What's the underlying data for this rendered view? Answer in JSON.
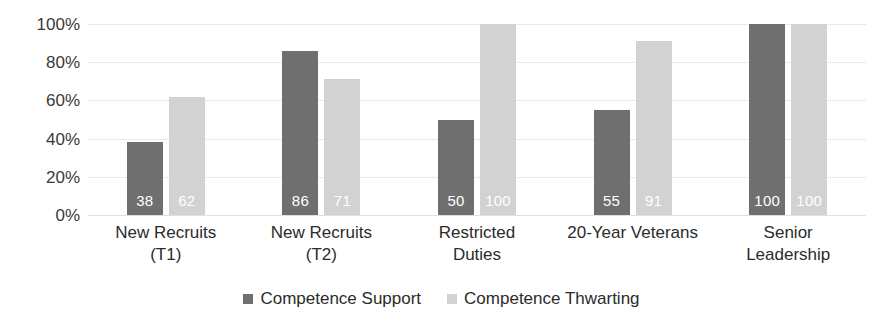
{
  "chart_data": {
    "type": "bar",
    "title": "",
    "subtitle": "",
    "xlabel": "",
    "ylabel": "",
    "ylim": [
      0,
      100
    ],
    "ytick_labels": [
      "100%",
      "80%",
      "60%",
      "40%",
      "20%",
      "0%"
    ],
    "ytick_values": [
      100,
      80,
      60,
      40,
      20,
      0
    ],
    "grid": true,
    "legend_position": "bottom",
    "categories": [
      "New Recruits\n(T1)",
      "New Recruits\n(T2)",
      "Restricted\nDuties",
      "20-Year Veterans",
      "Senior\nLeadership"
    ],
    "category_lines": [
      [
        "New Recruits",
        "(T1)"
      ],
      [
        "New Recruits",
        "(T2)"
      ],
      [
        "Restricted",
        "Duties"
      ],
      [
        "20-Year Veterans",
        ""
      ],
      [
        "Senior",
        "Leadership"
      ]
    ],
    "series": [
      {
        "name": "Competence Support",
        "color": "#6f6f6f",
        "values": [
          38,
          86,
          50,
          55,
          100
        ],
        "labels": [
          "38",
          "86",
          "50",
          "55",
          "100"
        ]
      },
      {
        "name": "Competence Thwarting",
        "color": "#d2d2d2",
        "values": [
          62,
          71,
          100,
          91,
          100
        ],
        "labels": [
          "62",
          "71",
          "100",
          "91",
          "100"
        ]
      }
    ]
  },
  "legend": {
    "items": [
      {
        "label": "Competence Support",
        "swatch": "support"
      },
      {
        "label": "Competence Thwarting",
        "swatch": "thwarting"
      }
    ]
  }
}
